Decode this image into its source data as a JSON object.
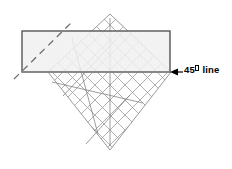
{
  "figure": {
    "type": "geometry-diagram",
    "background_color": "#ffffff",
    "annotation": {
      "text_before": "45",
      "degree_symbol": "°",
      "text_after": " line",
      "full_text": "45° line",
      "color": "#000000",
      "font_size_px": 9.5,
      "bold": true,
      "x": 184,
      "y": 64
    },
    "arrow": {
      "name": "leader-arrow",
      "direction": "left",
      "tip_x": 171,
      "tip_y": 72,
      "tail_x": 183,
      "tail_y": 72,
      "color": "#000000"
    },
    "rectangle": {
      "name": "shaded-rectangle",
      "x": 22,
      "y": 31,
      "width": 148,
      "height": 41,
      "fill": "#f1f1f1",
      "stroke": "#555555",
      "stroke_width": 1.4
    },
    "dashed_line": {
      "name": "dashed-45-line",
      "x1": 14,
      "y1": 79,
      "x2": 72,
      "y2": 22,
      "stroke": "#6e6e6e",
      "stroke_width": 1.3,
      "dash_pattern": "7 5",
      "angle_deg": 45
    },
    "baseline": {
      "name": "horizontal-baseline",
      "x1": 22,
      "y1": 72,
      "x2": 171,
      "y2": 72,
      "stroke": "#8a8a8a",
      "stroke_width": 1.6
    },
    "lattice": {
      "name": "rotated-square-lattice",
      "center_x": 110,
      "center_y": 72,
      "half_diagonal": 62,
      "top_vertex": [
        110,
        14
      ],
      "bottom_vertex": [
        110,
        150
      ],
      "left_vertex": [
        48,
        72
      ],
      "right_vertex": [
        171,
        72
      ],
      "cell_spacing_px": 10.6,
      "stroke": "#9a9a9a",
      "stroke_width": 0.8,
      "cell_count_per_side": 8
    },
    "chords": [
      {
        "name": "chord-a",
        "x1": 72,
        "y1": 38,
        "x2": 98,
        "y2": 134
      },
      {
        "name": "chord-b",
        "x1": 52,
        "y1": 82,
        "x2": 143,
        "y2": 103
      },
      {
        "name": "chord-c",
        "x1": 123,
        "y1": 32,
        "x2": 63,
        "y2": 96
      },
      {
        "name": "chord-d",
        "x1": 110,
        "y1": 18,
        "x2": 110,
        "y2": 146
      },
      {
        "name": "chord-e",
        "x1": 130,
        "y1": 95,
        "x2": 86,
        "y2": 144
      }
    ]
  }
}
